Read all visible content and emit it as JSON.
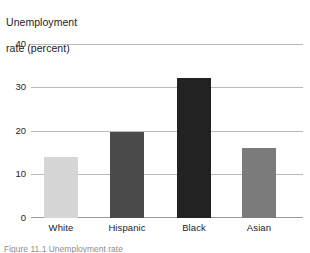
{
  "chart_data": {
    "type": "bar",
    "title": "Unemployment\nrate (percent)",
    "title_line1": "Unemployment",
    "title_line2": "rate (percent)",
    "xlabel": "",
    "ylabel": "Unemployment rate (percent)",
    "categories": [
      "White",
      "Hispanic",
      "Black",
      "Asian"
    ],
    "values": [
      14,
      19.7,
      32.2,
      16
    ],
    "ylim": [
      0,
      40
    ],
    "ytick_labels": [
      "40",
      "30",
      "20",
      "10",
      "0"
    ],
    "ytick_values": [
      40,
      30,
      20,
      10,
      0
    ],
    "grid": true,
    "legend": "none",
    "bar_colors": [
      "#d6d6d6",
      "#4b4b4b",
      "#222222",
      "#7b7b7b"
    ],
    "gridline_color": "#b9b9b9",
    "baseline_color": "#9a9a9a",
    "text_color": "#232323"
  },
  "caption": {
    "cutoff_text": "Figure 11.1  Unemployment rate"
  }
}
